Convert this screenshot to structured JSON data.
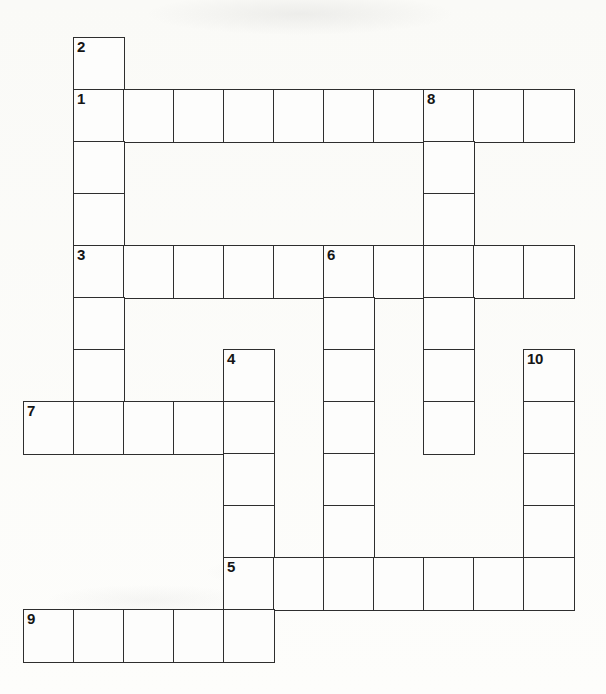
{
  "puzzle": {
    "title": "Crossword Grid",
    "geometry": {
      "origin_x": 23,
      "origin_y": 37,
      "cell_width": 50,
      "cell_height": 52,
      "columns": 12,
      "rows": 13
    },
    "style": {
      "grid_line_color": "#2e2e2e",
      "cell_fill": "#fdfdfc",
      "page_background": "#fcfcfa",
      "number_color": "#151515"
    },
    "entries": [
      {
        "number": "1",
        "direction": "across",
        "col": 1,
        "row": 1,
        "length": 10
      },
      {
        "number": "2",
        "direction": "down",
        "col": 1,
        "row": 0,
        "length": 7
      },
      {
        "number": "3",
        "direction": "across",
        "col": 1,
        "row": 4,
        "length": 10
      },
      {
        "number": "4",
        "direction": "down",
        "col": 4,
        "row": 6,
        "length": 6
      },
      {
        "number": "5",
        "direction": "across",
        "col": 4,
        "row": 10,
        "length": 7
      },
      {
        "number": "6",
        "direction": "down",
        "col": 6,
        "row": 4,
        "length": 7
      },
      {
        "number": "7",
        "direction": "across",
        "col": 0,
        "row": 7,
        "length": 5
      },
      {
        "number": "8",
        "direction": "down",
        "col": 8,
        "row": 1,
        "length": 7
      },
      {
        "number": "9",
        "direction": "across",
        "col": 0,
        "row": 11,
        "length": 5
      },
      {
        "number": "10",
        "direction": "down",
        "col": 10,
        "row": 6,
        "length": 5
      }
    ],
    "cells": [
      {
        "col": 1,
        "row": 0,
        "number": "2",
        "letter": ""
      },
      {
        "col": 1,
        "row": 1,
        "number": "1",
        "letter": ""
      },
      {
        "col": 2,
        "row": 1,
        "number": "",
        "letter": ""
      },
      {
        "col": 3,
        "row": 1,
        "number": "",
        "letter": ""
      },
      {
        "col": 4,
        "row": 1,
        "number": "",
        "letter": ""
      },
      {
        "col": 5,
        "row": 1,
        "number": "",
        "letter": ""
      },
      {
        "col": 6,
        "row": 1,
        "number": "",
        "letter": ""
      },
      {
        "col": 7,
        "row": 1,
        "number": "",
        "letter": ""
      },
      {
        "col": 8,
        "row": 1,
        "number": "8",
        "letter": ""
      },
      {
        "col": 9,
        "row": 1,
        "number": "",
        "letter": ""
      },
      {
        "col": 10,
        "row": 1,
        "number": "",
        "letter": ""
      },
      {
        "col": 1,
        "row": 2,
        "number": "",
        "letter": ""
      },
      {
        "col": 8,
        "row": 2,
        "number": "",
        "letter": ""
      },
      {
        "col": 1,
        "row": 3,
        "number": "",
        "letter": ""
      },
      {
        "col": 8,
        "row": 3,
        "number": "",
        "letter": ""
      },
      {
        "col": 1,
        "row": 4,
        "number": "3",
        "letter": ""
      },
      {
        "col": 2,
        "row": 4,
        "number": "",
        "letter": ""
      },
      {
        "col": 3,
        "row": 4,
        "number": "",
        "letter": ""
      },
      {
        "col": 4,
        "row": 4,
        "number": "",
        "letter": ""
      },
      {
        "col": 5,
        "row": 4,
        "number": "",
        "letter": ""
      },
      {
        "col": 6,
        "row": 4,
        "number": "6",
        "letter": ""
      },
      {
        "col": 7,
        "row": 4,
        "number": "",
        "letter": ""
      },
      {
        "col": 8,
        "row": 4,
        "number": "",
        "letter": ""
      },
      {
        "col": 9,
        "row": 4,
        "number": "",
        "letter": ""
      },
      {
        "col": 10,
        "row": 4,
        "number": "",
        "letter": ""
      },
      {
        "col": 1,
        "row": 5,
        "number": "",
        "letter": ""
      },
      {
        "col": 6,
        "row": 5,
        "number": "",
        "letter": ""
      },
      {
        "col": 8,
        "row": 5,
        "number": "",
        "letter": ""
      },
      {
        "col": 1,
        "row": 6,
        "number": "",
        "letter": ""
      },
      {
        "col": 4,
        "row": 6,
        "number": "4",
        "letter": ""
      },
      {
        "col": 6,
        "row": 6,
        "number": "",
        "letter": ""
      },
      {
        "col": 8,
        "row": 6,
        "number": "",
        "letter": ""
      },
      {
        "col": 10,
        "row": 6,
        "number": "10",
        "letter": ""
      },
      {
        "col": 0,
        "row": 7,
        "number": "7",
        "letter": ""
      },
      {
        "col": 1,
        "row": 7,
        "number": "",
        "letter": ""
      },
      {
        "col": 2,
        "row": 7,
        "number": "",
        "letter": ""
      },
      {
        "col": 3,
        "row": 7,
        "number": "",
        "letter": ""
      },
      {
        "col": 4,
        "row": 7,
        "number": "",
        "letter": ""
      },
      {
        "col": 6,
        "row": 7,
        "number": "",
        "letter": ""
      },
      {
        "col": 8,
        "row": 7,
        "number": "",
        "letter": ""
      },
      {
        "col": 10,
        "row": 7,
        "number": "",
        "letter": ""
      },
      {
        "col": 4,
        "row": 8,
        "number": "",
        "letter": ""
      },
      {
        "col": 6,
        "row": 8,
        "number": "",
        "letter": ""
      },
      {
        "col": 10,
        "row": 8,
        "number": "",
        "letter": ""
      },
      {
        "col": 4,
        "row": 9,
        "number": "",
        "letter": ""
      },
      {
        "col": 6,
        "row": 9,
        "number": "",
        "letter": ""
      },
      {
        "col": 10,
        "row": 9,
        "number": "",
        "letter": ""
      },
      {
        "col": 4,
        "row": 10,
        "number": "5",
        "letter": ""
      },
      {
        "col": 5,
        "row": 10,
        "number": "",
        "letter": ""
      },
      {
        "col": 6,
        "row": 10,
        "number": "",
        "letter": ""
      },
      {
        "col": 7,
        "row": 10,
        "number": "",
        "letter": ""
      },
      {
        "col": 8,
        "row": 10,
        "number": "",
        "letter": ""
      },
      {
        "col": 9,
        "row": 10,
        "number": "",
        "letter": ""
      },
      {
        "col": 10,
        "row": 10,
        "number": "",
        "letter": ""
      },
      {
        "col": 0,
        "row": 11,
        "number": "9",
        "letter": ""
      },
      {
        "col": 1,
        "row": 11,
        "number": "",
        "letter": ""
      },
      {
        "col": 2,
        "row": 11,
        "number": "",
        "letter": ""
      },
      {
        "col": 3,
        "row": 11,
        "number": "",
        "letter": ""
      },
      {
        "col": 4,
        "row": 11,
        "number": "",
        "letter": ""
      }
    ]
  }
}
